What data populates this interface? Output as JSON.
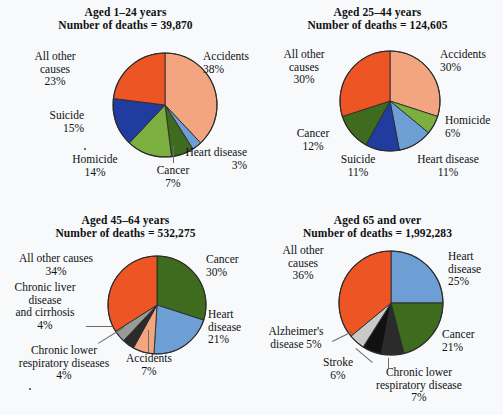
{
  "background_color": "#f7f9fb",
  "palette": {
    "accidents": "#F3A580",
    "heart_disease": "#6D9FD4",
    "cancer": "#3E6B1E",
    "homicide": "#7BB040",
    "suicide": "#1F3C9E",
    "all_other_causes": "#EE5524",
    "chronic_liver": "#9A9A9A",
    "chronic_lower_resp": "#2B2B2B",
    "alzheimers": "#C9C9C9",
    "stroke": "#111111",
    "outline": "#2b2b2b",
    "leader_line": "#6b6b6b",
    "text": "#111111"
  },
  "chart_data": [
    {
      "type": "pie",
      "id": "aged-1-24",
      "title": "Aged 1–24 years",
      "subtitle": "Number of deaths = 39,870",
      "total_deaths": 39870,
      "categories": [
        "Accidents",
        "Heart disease",
        "Cancer",
        "Homicide",
        "Suicide",
        "All other causes"
      ],
      "values": [
        38,
        3,
        7,
        14,
        15,
        23
      ],
      "unit": "percent",
      "colors": [
        "#F3A580",
        "#6D9FD4",
        "#3E6B1E",
        "#7BB040",
        "#1F3C9E",
        "#EE5524"
      ],
      "labels": [
        {
          "name": "Accidents",
          "pct": "38%",
          "text": "Accidents\n38%"
        },
        {
          "name": "Heart disease",
          "pct": "3%",
          "text": "Heart disease\n3%"
        },
        {
          "name": "Cancer",
          "pct": "7%",
          "text": "Cancer\n7%"
        },
        {
          "name": "Homicide",
          "pct": "14%",
          "text": "Homicide\n14%"
        },
        {
          "name": "Suicide",
          "pct": "15%",
          "text": "Suicide\n15%"
        },
        {
          "name": "All other causes",
          "pct": "23%",
          "text": "All other\ncauses\n23%"
        }
      ]
    },
    {
      "type": "pie",
      "id": "aged-25-44",
      "title": "Aged 25–44 years",
      "subtitle": "Number of deaths = 124,605",
      "total_deaths": 124605,
      "categories": [
        "Accidents",
        "Homicide",
        "Heart disease",
        "Suicide",
        "Cancer",
        "All other causes"
      ],
      "values": [
        30,
        6,
        11,
        11,
        12,
        30
      ],
      "unit": "percent",
      "colors": [
        "#F3A580",
        "#7BB040",
        "#6D9FD4",
        "#1F3C9E",
        "#3E6B1E",
        "#EE5524"
      ],
      "labels": [
        {
          "name": "Accidents",
          "pct": "30%",
          "text": "Accidents\n30%"
        },
        {
          "name": "Homicide",
          "pct": "6%",
          "text": "Homicide\n6%"
        },
        {
          "name": "Heart disease",
          "pct": "11%",
          "text": "Heart disease\n11%"
        },
        {
          "name": "Suicide",
          "pct": "11%",
          "text": "Suicide\n11%"
        },
        {
          "name": "Cancer",
          "pct": "12%",
          "text": "Cancer\n12%"
        },
        {
          "name": "All other causes",
          "pct": "30%",
          "text": "All other\ncauses\n30%"
        }
      ]
    },
    {
      "type": "pie",
      "id": "aged-45-64",
      "title": "Aged 45–64 years",
      "subtitle": "Number of deaths = 532,275",
      "total_deaths": 532275,
      "categories": [
        "Cancer",
        "Heart disease",
        "Accidents",
        "Chronic lower respiratory diseases",
        "Chronic liver disease and cirrhosis",
        "All other causes"
      ],
      "values": [
        30,
        21,
        7,
        4,
        4,
        34
      ],
      "unit": "percent",
      "colors": [
        "#3E6B1E",
        "#6D9FD4",
        "#F3A580",
        "#2B2B2B",
        "#9A9A9A",
        "#EE5524"
      ],
      "labels": [
        {
          "name": "Cancer",
          "pct": "30%",
          "text": "Cancer\n30%"
        },
        {
          "name": "Heart disease",
          "pct": "21%",
          "text": "Heart\ndisease\n21%"
        },
        {
          "name": "Accidents",
          "pct": "7%",
          "text": "Accidents\n7%"
        },
        {
          "name": "Chronic lower respiratory diseases",
          "pct": "4%",
          "text": "Chronic lower\nrespiratory diseases\n4%"
        },
        {
          "name": "Chronic liver disease and cirrhosis",
          "pct": "4%",
          "text": "Chronic liver\ndisease\nand cirrhosis\n4%"
        },
        {
          "name": "All other causes",
          "pct": "34%",
          "text": "All other causes\n34%"
        }
      ]
    },
    {
      "type": "pie",
      "id": "aged-65-over",
      "title": "Aged 65 and over",
      "subtitle": "Number of deaths = 1,992,283",
      "total_deaths": 1992283,
      "categories": [
        "Heart disease",
        "Cancer",
        "Chronic lower respiratory disease",
        "Stroke",
        "Alzheimer's disease",
        "All other causes"
      ],
      "values": [
        25,
        21,
        7,
        6,
        5,
        36
      ],
      "unit": "percent",
      "colors": [
        "#6D9FD4",
        "#3E6B1E",
        "#2B2B2B",
        "#111111",
        "#C9C9C9",
        "#EE5524"
      ],
      "labels": [
        {
          "name": "Heart disease",
          "pct": "25%",
          "text": "Heart\ndisease\n25%"
        },
        {
          "name": "Cancer",
          "pct": "21%",
          "text": "Cancer\n21%"
        },
        {
          "name": "Chronic lower respiratory disease",
          "pct": "7%",
          "text": "Chronic lower\nrespiratory disease\n7%"
        },
        {
          "name": "Stroke",
          "pct": "6%",
          "text": "Stroke\n6%"
        },
        {
          "name": "Alzheimer's disease",
          "pct": "5%",
          "text": "Alzheimer's\ndisease 5%"
        },
        {
          "name": "All other causes",
          "pct": "36%",
          "text": "All other\ncauses\n36%"
        }
      ]
    }
  ]
}
